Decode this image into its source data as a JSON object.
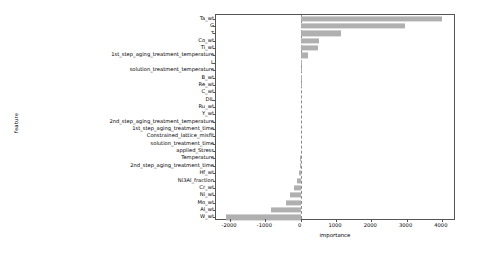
{
  "chart_data": {
    "type": "bar",
    "orientation": "horizontal",
    "title": "",
    "xlabel": "importance",
    "ylabel": "feature",
    "xlim": [
      -2400,
      4400
    ],
    "xticks": [
      -2000,
      -1000,
      0,
      1000,
      2000,
      3000,
      4000
    ],
    "xticklabels": [
      "-2000",
      "-1000",
      "0",
      "1000",
      "2000",
      "3000",
      "4000"
    ],
    "grid": false,
    "legend": null,
    "zero_reference_line": 0,
    "bar_color": "#b0b0b0",
    "categories": [
      "Ta_wt",
      "G",
      "τ",
      "Co_wt",
      "Ti_wt",
      "1st_step_aging_treatment_temperature",
      "L",
      "solution_treatment_temperature",
      "B_wt",
      "Re_wt",
      "C_wt",
      "DIL",
      "Ru_wt",
      "Y_wt",
      "2nd_step_aging_treatment_temperature",
      "1st_step_aging_treatment_time",
      "Constrained_lattice_misfit",
      "solution_treatment_time",
      "applied_Stress",
      "Temperature",
      "2nd_step_aging_treatment_time",
      "Hf_wt",
      "Ni3Al_fraction",
      "Cr_wt",
      "Ni_wt",
      "Mo_wt",
      "Al_wt",
      "W_wt"
    ],
    "values": [
      4000,
      2960,
      1140,
      520,
      500,
      210,
      20,
      10,
      5,
      3,
      2,
      0,
      0,
      0,
      0,
      0,
      0,
      0,
      0,
      -10,
      -30,
      -60,
      -110,
      -190,
      -300,
      -420,
      -830,
      -2120
    ]
  }
}
